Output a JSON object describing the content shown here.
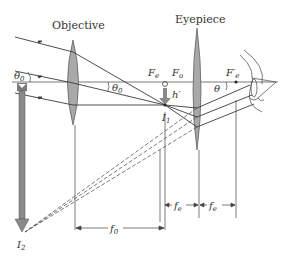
{
  "labels": {
    "objective": "Objective",
    "eyepiece": "Eyepiece",
    "theta0_left": "θ",
    "theta0_left_sub": "0",
    "theta0_mid": "θ",
    "theta0_mid_sub": "0",
    "theta": "θ",
    "Fe": "F",
    "Fe_sub": "e",
    "Fo": "F",
    "Fo_sub": "o",
    "Fe_prime": "F′",
    "Fe_prime_sub": "e",
    "h_prime": "h′",
    "I1": "I",
    "I1_sub": "1",
    "I2": "I",
    "I2_sub": "2",
    "f0": "f",
    "f0_sub": "0",
    "fe1": "f",
    "fe1_sub": "e",
    "fe2": "f",
    "fe2_sub": "e"
  },
  "colors": {
    "lens_fill": "#a9a9a9",
    "lens_stroke": "#555555",
    "ray": "#3a3a3a",
    "object_fill": "#8a8a8a",
    "text": "#333333"
  }
}
